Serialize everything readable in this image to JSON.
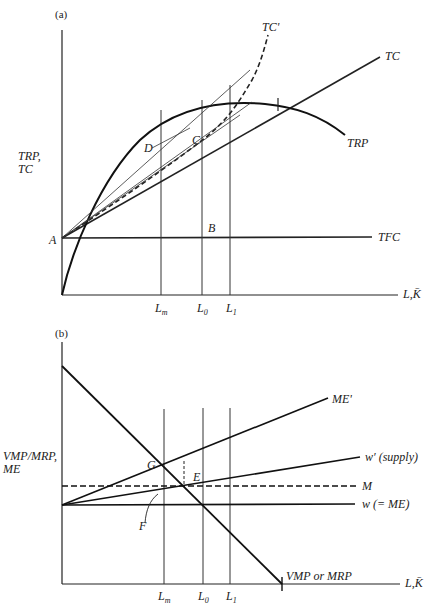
{
  "figure": {
    "caption_fragment": "",
    "panel_a": {
      "tag": "(a)",
      "y_axis_label_line1": "TRP,",
      "y_axis_label_line2": "TC",
      "x_axis_label": "L,K̄",
      "curves": {
        "tc": "TC",
        "tc_prime": "TC'",
        "trp": "TRP",
        "tfc": "TFC"
      },
      "points": {
        "a": "A",
        "b": "B",
        "c": "C",
        "d": "D"
      },
      "x_ticks": {
        "lm": "L",
        "lm_sub": "m",
        "l0": "L",
        "l0_sub": "0",
        "l1": "L",
        "l1_sub": "1"
      }
    },
    "panel_b": {
      "tag": "(b)",
      "y_axis_label_line1": "VMP/MRP,",
      "y_axis_label_line2": "ME",
      "x_axis_label": "L,K̄",
      "curves": {
        "me_prime": "ME'",
        "w_prime": "w′ (supply)",
        "m": "M",
        "w": "w (= ME)",
        "vmp": "VMP or MRP"
      },
      "points": {
        "g": "G",
        "e": "E",
        "f": "F"
      },
      "x_ticks": {
        "lm": "L",
        "lm_sub": "m",
        "l0": "L",
        "l0_sub": "0",
        "l1": "L",
        "l1_sub": "1"
      }
    }
  }
}
